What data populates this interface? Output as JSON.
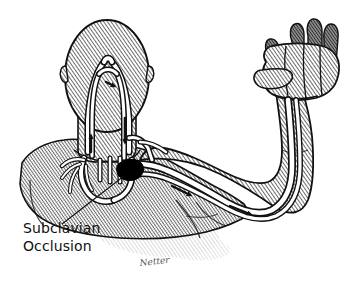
{
  "figure": {
    "background_color": "#ffffff",
    "ink_color": "#111111",
    "body_fill_color": "#9a9a9a",
    "vessel_fill_color": "#ffffff",
    "occlusion_color": "#000000",
    "finger_shadow_color": "#6e6e6e",
    "shadow_color": "#b8b8b8"
  },
  "annotations": {
    "occlusion_label": {
      "line1": "Subclavian",
      "line2": "Occlusion",
      "leader_line": "present"
    },
    "signature": {
      "text": "Netter"
    }
  },
  "anatomy": {
    "head": {
      "name": "head-posterior-view",
      "shading": "diagonal-hatch"
    },
    "neck": {
      "name": "neck",
      "shading": "diagonal-hatch"
    },
    "torso": {
      "name": "torso-shoulders",
      "shading": "crosshatch-stipple"
    },
    "arm": {
      "name": "left-arm-raised",
      "shading": "diagonal-hatch"
    },
    "hand": {
      "name": "clenched-fist",
      "shading": "diagonal-hatch",
      "fingers": 4,
      "finger_tip_shading": "dark-gray"
    }
  },
  "vessels": {
    "basilar_artery": {
      "label": "basilar-artery",
      "location": "top-of-head-loop"
    },
    "left_vertebral_artery": {
      "label": "left-vertebral-artery",
      "flow": "antegrade-upward"
    },
    "right_vertebral_artery": {
      "label": "right-vertebral-artery",
      "flow": "retrograde-downward"
    },
    "aortic_arch": {
      "label": "aortic-arch"
    },
    "subclavian_artery": {
      "label": "subclavian-artery",
      "status": "occluded"
    },
    "brachial_artery": {
      "label": "brachial-artery",
      "flow": "toward-hand"
    },
    "carotid_arteries": {
      "label": "carotid-arteries"
    }
  },
  "flow_arrows": [
    {
      "id": "arrow-basilar",
      "direction": "rightward",
      "region": "basilar-loop"
    },
    {
      "id": "arrow-left-vertebral-up",
      "direction": "upward",
      "region": "left-vertebral-neck"
    },
    {
      "id": "arrow-right-vertebral-down",
      "direction": "downward",
      "region": "right-vertebral-neck"
    },
    {
      "id": "arrow-upper-arm",
      "direction": "toward-hand",
      "region": "upper-arm"
    },
    {
      "id": "arrow-lower-arm",
      "direction": "toward-hand",
      "region": "distal-upper-arm"
    }
  ]
}
